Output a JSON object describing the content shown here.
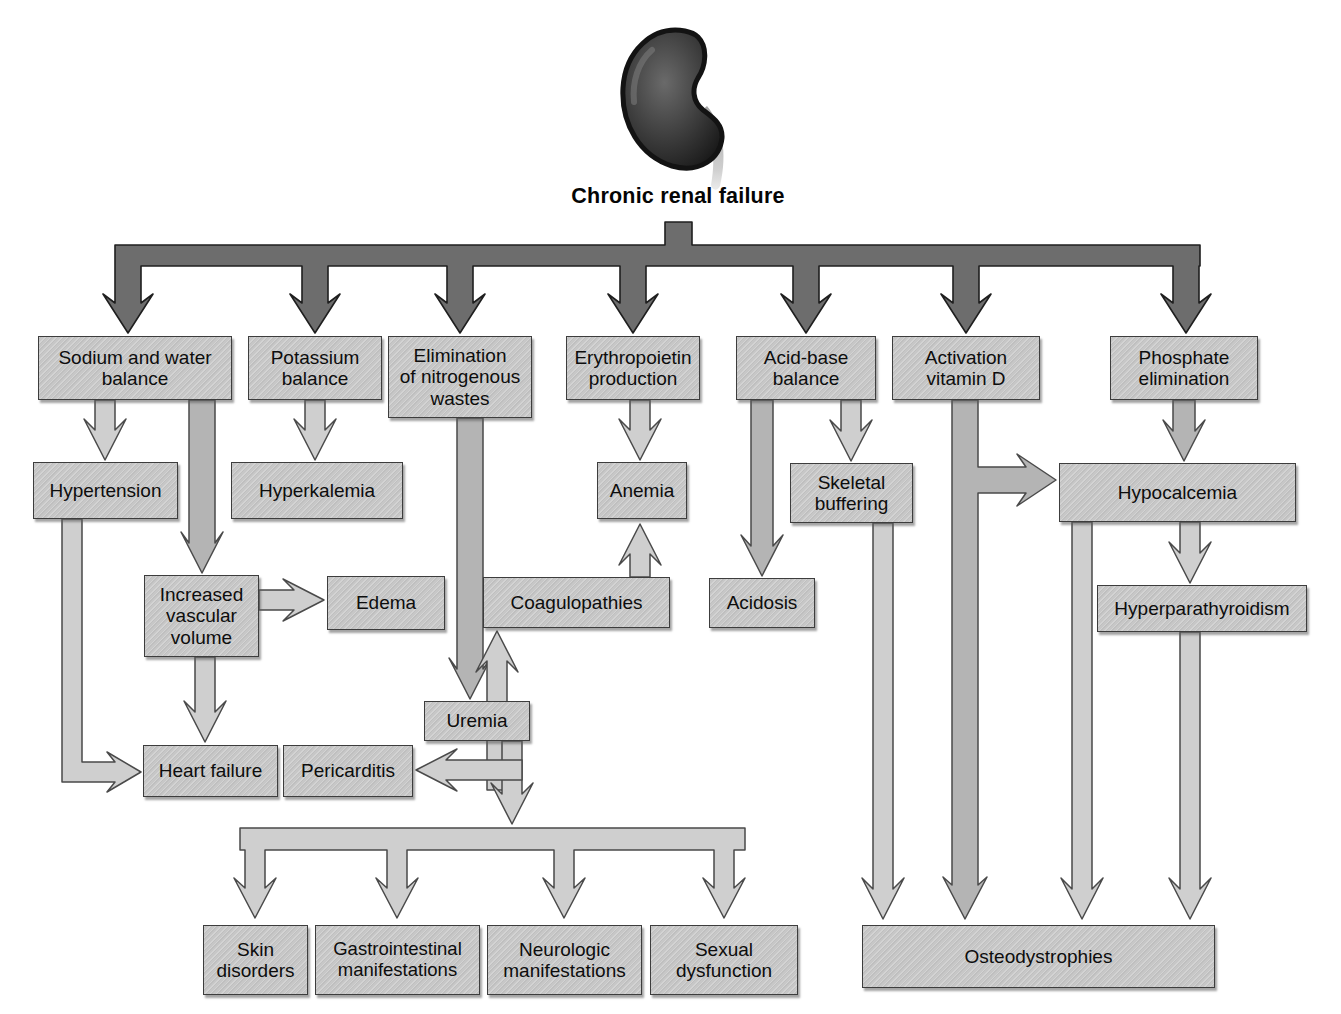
{
  "title": "Chronic renal failure",
  "icon": "kidney-icon",
  "colors": {
    "background": "#ffffff",
    "box_fill": "#c7c7c7",
    "box_border": "#3d3d3d",
    "dark_arrow": "#6d6d6d",
    "dark_arrow_outline": "#1f1f1f",
    "light_arrow": "#cfcfcf",
    "medium_arrow": "#b4b4b4",
    "arrow_outline": "#4a4a4a",
    "text": "#0d0d0d"
  },
  "nodes": {
    "sodium_water": "Sodium and water\nbalance",
    "potassium": "Potassium\nbalance",
    "elimination": "Elimination\nof nitrogenous\nwastes",
    "erythropoietin": "Erythropoietin\nproduction",
    "acid_base": "Acid-base\nbalance",
    "activation_d": "Activation\nvitamin D",
    "phosphate": "Phosphate\nelimination",
    "hypertension": "Hypertension",
    "hyperkalemia": "Hyperkalemia",
    "anemia": "Anemia",
    "skeletal": "Skeletal\nbuffering",
    "hypocalcemia": "Hypocalcemia",
    "ivv": "Increased\nvascular\nvolume",
    "edema": "Edema",
    "coagulopathies": "Coagulopathies",
    "acidosis": "Acidosis",
    "hyperparathyroidism": "Hyperparathyroidism",
    "uremia": "Uremia",
    "heart_failure": "Heart failure",
    "pericarditis": "Pericarditis",
    "skin": "Skin\ndisorders",
    "gi": "Gastrointestinal\nmanifestations",
    "neuro": "Neurologic\nmanifestations",
    "sexual": "Sexual\ndysfunction",
    "osteodystrophies": "Osteodystrophies"
  },
  "edges": [
    {
      "from": "chronic_renal_failure",
      "to": "sodium_water"
    },
    {
      "from": "chronic_renal_failure",
      "to": "potassium"
    },
    {
      "from": "chronic_renal_failure",
      "to": "elimination"
    },
    {
      "from": "chronic_renal_failure",
      "to": "erythropoietin"
    },
    {
      "from": "chronic_renal_failure",
      "to": "acid_base"
    },
    {
      "from": "chronic_renal_failure",
      "to": "activation_d"
    },
    {
      "from": "chronic_renal_failure",
      "to": "phosphate"
    },
    {
      "from": "sodium_water",
      "to": "hypertension"
    },
    {
      "from": "sodium_water",
      "to": "ivv"
    },
    {
      "from": "potassium",
      "to": "hyperkalemia"
    },
    {
      "from": "elimination",
      "to": "uremia"
    },
    {
      "from": "erythropoietin",
      "to": "anemia"
    },
    {
      "from": "acid_base",
      "to": "acidosis"
    },
    {
      "from": "acid_base",
      "to": "skeletal"
    },
    {
      "from": "activation_d",
      "to": "hypocalcemia"
    },
    {
      "from": "activation_d",
      "to": "osteodystrophies"
    },
    {
      "from": "phosphate",
      "to": "hypocalcemia"
    },
    {
      "from": "hypertension",
      "to": "heart_failure"
    },
    {
      "from": "ivv",
      "to": "edema"
    },
    {
      "from": "ivv",
      "to": "heart_failure"
    },
    {
      "from": "coagulopathies",
      "to": "anemia"
    },
    {
      "from": "uremia",
      "to": "coagulopathies"
    },
    {
      "from": "uremia",
      "to": "pericarditis"
    },
    {
      "from": "uremia",
      "to": "skin"
    },
    {
      "from": "uremia",
      "to": "gi"
    },
    {
      "from": "uremia",
      "to": "neuro"
    },
    {
      "from": "uremia",
      "to": "sexual"
    },
    {
      "from": "skeletal",
      "to": "osteodystrophies"
    },
    {
      "from": "hypocalcemia",
      "to": "hyperparathyroidism"
    },
    {
      "from": "hypocalcemia",
      "to": "osteodystrophies"
    },
    {
      "from": "hyperparathyroidism",
      "to": "osteodystrophies"
    }
  ]
}
